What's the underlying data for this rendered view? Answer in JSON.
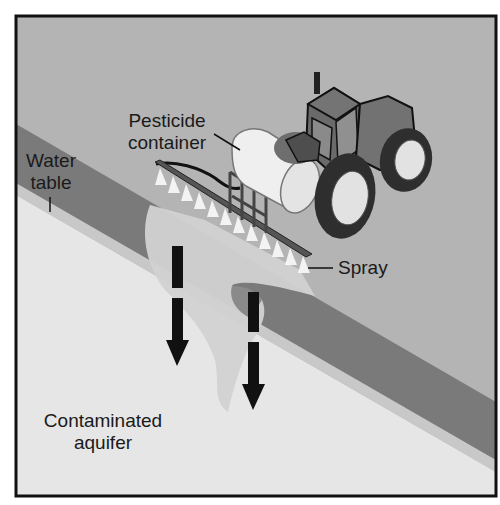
{
  "diagram": {
    "labels": {
      "pesticide_container_line1": "Pesticide",
      "pesticide_container_line2": "container",
      "water_table_line1": "Water",
      "water_table_line2": "table",
      "spray": "Spray",
      "contaminated_aquifer_line1": "Contaminated",
      "contaminated_aquifer_line2": "aquifer"
    },
    "colors": {
      "sky_ground": "#b4b4b4",
      "water_table_band": "#7a7a7a",
      "light_band": "#c8c8c8",
      "aquifer": "#e6e6e6",
      "plume": "#d2d2d2",
      "tractor_body": "#6e6e6e",
      "tank": "#efefef",
      "arrows": "#111111",
      "frame": "#111111"
    }
  }
}
